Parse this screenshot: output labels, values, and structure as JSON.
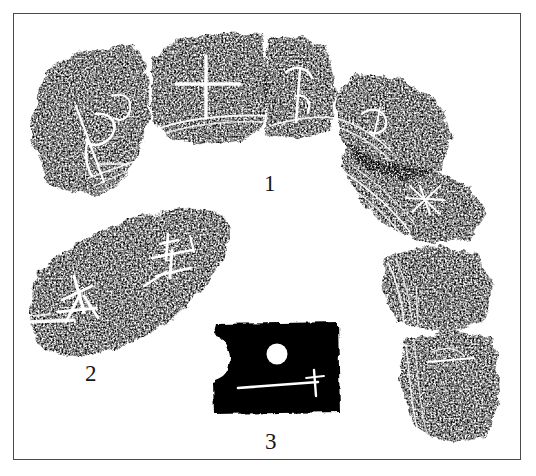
{
  "figure": {
    "kind": "archaeological-rubbing-plate",
    "background_color": "#ffffff",
    "ink_color": "#000000",
    "incision_color": "#ffffff",
    "border_color": "#4a4a4a",
    "caption_color": "#16161a",
    "border": {
      "x": 13,
      "y": 13,
      "width": 508,
      "height": 447
    }
  },
  "captions": [
    {
      "id": "caption-1",
      "label": "1",
      "x": 264,
      "y": 172,
      "refers_to": "arc-assembly-of-curved-fragments"
    },
    {
      "id": "caption-2",
      "label": "2",
      "x": 85,
      "y": 362,
      "refers_to": "lens-shaped-fragment"
    },
    {
      "id": "caption-3",
      "label": "3",
      "x": 265,
      "y": 430,
      "refers_to": "rectangular-plaque-with-hole"
    }
  ],
  "objects": [
    {
      "id": "object-1",
      "name": "arc-assembly-of-curved-fragments",
      "caption": "1",
      "description": "Six curved black rubbing fragments arranged in a broad arc sweeping from upper-left, across the top, and down the right side; thin white cracks separate adjacent fragments; fine white incised strokes and parallel groove lines appear across the band.",
      "fragment_count": 6,
      "fragments": [
        {
          "id": "fragment-1a",
          "position": "upper-left",
          "marks": [
            "curved-hook-glyph",
            "parallel-groove-lines"
          ]
        },
        {
          "id": "fragment-1b",
          "position": "top-left-of-center",
          "marks": [
            "cross-plus-glyph",
            "rim-groove-line"
          ]
        },
        {
          "id": "fragment-1c",
          "position": "top-right-of-center",
          "marks": [
            "branching-glyph",
            "ladder-mark",
            "rim-groove-line"
          ]
        },
        {
          "id": "fragment-1d",
          "position": "upper-right",
          "marks": [
            "hook-glyph",
            "parallel-groove-lines"
          ]
        },
        {
          "id": "fragment-1e",
          "position": "right",
          "marks": [
            "star-asterisk-glyph",
            "parallel-groove-lines"
          ]
        },
        {
          "id": "fragment-1f",
          "position": "lower-right",
          "marks": [
            "horizontal-stroke",
            "groove-lines"
          ]
        }
      ]
    },
    {
      "id": "object-2",
      "name": "lens-shaped-fragment",
      "caption": "2",
      "description": "A solid black lens (crescent / pointed-oval) shaped rubbing tilted down to the left, bearing two white incised characters and a white break-edge streak along the lower-left margin.",
      "marks": [
        "incised-character-left",
        "incised-character-right",
        "break-edge-streak"
      ]
    },
    {
      "id": "object-3",
      "name": "rectangular-plaque-with-hole",
      "caption": "3",
      "description": "A solid black rectangular rubbing with a semicircular notch cut into its left edge, a round white perforation in the upper-middle, and a long horizontal white incised stroke crossed by a short vertical stroke near its right end.",
      "marks": [
        "circular-perforation",
        "semicircular-edge-notch",
        "horizontal-incised-stroke",
        "vertical-tick-stroke"
      ]
    }
  ]
}
